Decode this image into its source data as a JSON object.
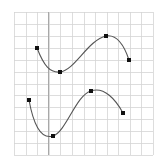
{
  "figure": {
    "type": "curve-sketch",
    "grid": {
      "x0": 14,
      "y0": 12,
      "x1": 153,
      "y1": 155,
      "cols": 12,
      "rows": 12,
      "line_color": "#d4d4d4",
      "axis_x": 48,
      "axis_color": "#a8a8a8"
    },
    "curve_color": "#555555",
    "point_color": "#111111",
    "curves": [
      {
        "name": "upper-curve",
        "points": [
          [
            37,
            48
          ],
          [
            60,
            72
          ],
          [
            106,
            36
          ],
          [
            129,
            60
          ]
        ],
        "path": "M37,48 C44,66 50,73 60,72 C75,70 88,40 106,36 C118,34 125,48 129,60"
      },
      {
        "name": "lower-curve",
        "points": [
          [
            29,
            100
          ],
          [
            53,
            136
          ],
          [
            91,
            91
          ],
          [
            123,
            113
          ]
        ],
        "path": "M29,100 C33,122 40,140 53,136 C66,132 76,95 91,91 C104,86 116,100 123,113"
      }
    ]
  }
}
